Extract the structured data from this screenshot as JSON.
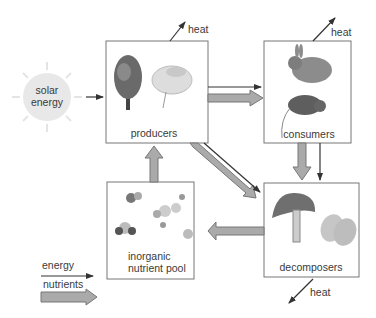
{
  "diagram": {
    "sun": {
      "line1": "solar",
      "line2": "energy"
    },
    "boxes": {
      "producers": "producers",
      "consumers": "consumers",
      "inorganic_line1": "inorganic",
      "inorganic_line2": "nutrient pool",
      "decomposers": "decomposers"
    },
    "heat_labels": [
      "heat",
      "heat",
      "heat"
    ],
    "legend": {
      "energy": "energy",
      "nutrients": "nutrients"
    },
    "colors": {
      "box_border": "#777777",
      "nutrient_arrow": "#aaaaaa",
      "energy_arrow": "#333333",
      "sun": "#e6e6e6"
    }
  }
}
